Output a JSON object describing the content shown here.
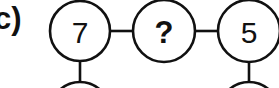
{
  "figure": {
    "panel_label": "c)",
    "background_color": "#ffffff",
    "stroke_color": "#111111"
  },
  "diagram": {
    "type": "number-circle-chain",
    "nodes": [
      {
        "id": "node-left",
        "value": "7",
        "is_unknown": false,
        "cx": 80,
        "cy": 31,
        "r": 30,
        "has_child_stem": true
      },
      {
        "id": "node-middle",
        "value": "?",
        "is_unknown": true,
        "cx": 164,
        "cy": 31,
        "r": 31,
        "has_child_stem": false
      },
      {
        "id": "node-right",
        "value": "5",
        "is_unknown": false,
        "cx": 249,
        "cy": 31,
        "r": 31,
        "has_child_stem": true
      }
    ],
    "connectors": [
      {
        "id": "connector-left-middle",
        "x1": 110,
        "x2": 133,
        "y": 31
      },
      {
        "id": "connector-middle-right",
        "x1": 195,
        "x2": 218,
        "y": 31
      }
    ],
    "stems": [
      {
        "id": "stem-left",
        "x": 80,
        "y1": 61,
        "y2": 83
      },
      {
        "id": "stem-right",
        "x": 249,
        "y1": 62,
        "y2": 83
      }
    ],
    "child_arcs": [
      {
        "id": "child-arc-left",
        "cx": 80,
        "cy": 112,
        "r": 30
      },
      {
        "id": "child-arc-right",
        "cx": 249,
        "cy": 112,
        "r": 30
      }
    ]
  }
}
